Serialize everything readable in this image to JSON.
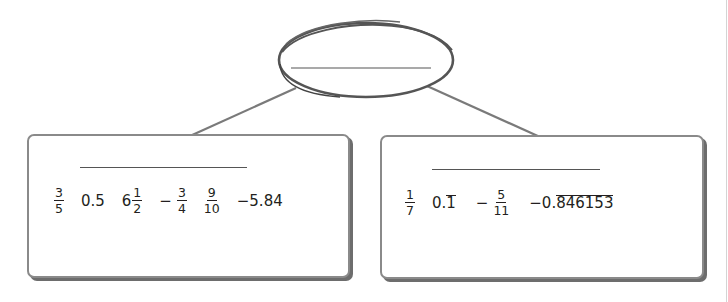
{
  "diagram": {
    "type": "classification-tree",
    "root": {
      "label": "",
      "blank": true,
      "shape": "oval"
    },
    "children": [
      {
        "label": "",
        "blank": true,
        "numbers": [
          {
            "kind": "fraction",
            "neg": "",
            "num": "3",
            "den": "5"
          },
          {
            "kind": "decimal",
            "text": "0.5"
          },
          {
            "kind": "mixed",
            "whole": "6",
            "num": "1",
            "den": "2"
          },
          {
            "kind": "fraction",
            "neg": "−",
            "num": "3",
            "den": "4"
          },
          {
            "kind": "fraction",
            "neg": "",
            "num": "9",
            "den": "10"
          },
          {
            "kind": "decimal",
            "text": "−5.84"
          }
        ]
      },
      {
        "label": "",
        "blank": true,
        "numbers": [
          {
            "kind": "fraction",
            "neg": "",
            "num": "1",
            "den": "7"
          },
          {
            "kind": "repeating",
            "prefix": "0.",
            "repeat": "1"
          },
          {
            "kind": "fraction",
            "neg": "−",
            "num": "5",
            "den": "11"
          },
          {
            "kind": "repeating",
            "prefix": "−0.",
            "repeat": "846153"
          }
        ]
      }
    ],
    "colors": {
      "stroke": "#6d6d6d",
      "oval": "#5a5a5a",
      "text": "#231f20"
    }
  }
}
